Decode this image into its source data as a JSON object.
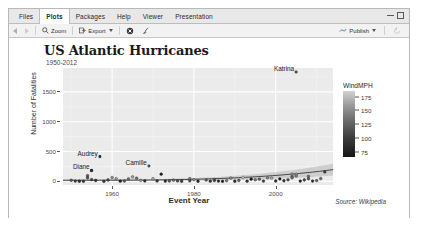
{
  "window": {
    "tabs": [
      {
        "label": "Files",
        "active": false
      },
      {
        "label": "Plots",
        "active": true
      },
      {
        "label": "Packages",
        "active": false
      },
      {
        "label": "Help",
        "active": false
      },
      {
        "label": "Viewer",
        "active": false
      },
      {
        "label": "Presentation",
        "active": false
      }
    ],
    "controls": {
      "minimize": "minimize-icon",
      "maximize": "maximize-icon"
    }
  },
  "toolbar": {
    "back_icon": "back-arrow-icon",
    "forward_icon": "forward-arrow-icon",
    "zoom_label": "Zoom",
    "zoom_icon": "magnifier-icon",
    "export_label": "Export",
    "export_icon": "export-icon",
    "remove_icon": "remove-plot-icon",
    "clear_icon": "clear-all-plots-icon",
    "publish_label": "Publish",
    "publish_icon": "publish-icon",
    "refresh_icon": "refresh-icon"
  },
  "chart_data": {
    "type": "scatter",
    "title": "US Atlantic Hurricanes",
    "subtitle": "1950-2012",
    "caption": "Source: Wikipedia",
    "xlabel": "Event Year",
    "ylabel": "Number of Fatalities",
    "xlim": [
      1948,
      2014
    ],
    "ylim": [
      -60,
      1900
    ],
    "xticks": [
      1960,
      1980,
      2000
    ],
    "yticks": [
      0,
      500,
      1000,
      1500
    ],
    "ytick_labels": [
      "0",
      "500",
      "1000",
      "1500"
    ],
    "grid": true,
    "panel_background": "#ebebeb",
    "gridline_color": "#ffffff",
    "point_color_scale": "grey",
    "smooth_line": true,
    "smooth_line_color": "#3a3a3a",
    "smooth_ribbon_color": "#b4b4b4",
    "legend": {
      "title": "WindMPH",
      "position": "right",
      "ticks": [
        175,
        150,
        125,
        100,
        75
      ],
      "tick_labels": [
        "175",
        "150",
        "125",
        "100",
        "75"
      ],
      "gradient_high": "#d2d2d2",
      "gradient_low": "#151515"
    },
    "annotations": [
      {
        "label": "Katrina",
        "x": 2005,
        "y": 1833
      },
      {
        "label": "Audrey",
        "x": 1957,
        "y": 416
      },
      {
        "label": "Diane",
        "x": 1955,
        "y": 184
      },
      {
        "label": "Camille",
        "x": 1969,
        "y": 259
      }
    ],
    "points": [
      {
        "x": 1950,
        "y": 19,
        "wind": 110
      },
      {
        "x": 1951,
        "y": 6,
        "wind": 95
      },
      {
        "x": 1952,
        "y": 3,
        "wind": 85
      },
      {
        "x": 1953,
        "y": 2,
        "wind": 90
      },
      {
        "x": 1954,
        "y": 95,
        "wind": 115
      },
      {
        "x": 1954,
        "y": 60,
        "wind": 105
      },
      {
        "x": 1955,
        "y": 184,
        "wind": 120
      },
      {
        "x": 1955,
        "y": 30,
        "wind": 100
      },
      {
        "x": 1956,
        "y": 15,
        "wind": 85
      },
      {
        "x": 1957,
        "y": 416,
        "wind": 145
      },
      {
        "x": 1958,
        "y": 2,
        "wind": 90
      },
      {
        "x": 1959,
        "y": 24,
        "wind": 100
      },
      {
        "x": 1960,
        "y": 65,
        "wind": 140
      },
      {
        "x": 1961,
        "y": 46,
        "wind": 150
      },
      {
        "x": 1962,
        "y": 4,
        "wind": 80
      },
      {
        "x": 1963,
        "y": 7,
        "wind": 110
      },
      {
        "x": 1964,
        "y": 41,
        "wind": 125
      },
      {
        "x": 1965,
        "y": 75,
        "wind": 150
      },
      {
        "x": 1966,
        "y": 54,
        "wind": 125
      },
      {
        "x": 1967,
        "y": 18,
        "wind": 145
      },
      {
        "x": 1968,
        "y": 9,
        "wind": 85
      },
      {
        "x": 1969,
        "y": 259,
        "wind": 175
      },
      {
        "x": 1970,
        "y": 46,
        "wind": 160
      },
      {
        "x": 1971,
        "y": 8,
        "wind": 90
      },
      {
        "x": 1972,
        "y": 122,
        "wind": 75
      },
      {
        "x": 1973,
        "y": 5,
        "wind": 80
      },
      {
        "x": 1974,
        "y": 8,
        "wind": 110
      },
      {
        "x": 1975,
        "y": 21,
        "wind": 120
      },
      {
        "x": 1976,
        "y": 9,
        "wind": 100
      },
      {
        "x": 1977,
        "y": 3,
        "wind": 95
      },
      {
        "x": 1979,
        "y": 45,
        "wind": 130
      },
      {
        "x": 1979,
        "y": 10,
        "wind": 105
      },
      {
        "x": 1980,
        "y": 28,
        "wind": 145
      },
      {
        "x": 1981,
        "y": 3,
        "wind": 85
      },
      {
        "x": 1983,
        "y": 22,
        "wind": 115
      },
      {
        "x": 1984,
        "y": 4,
        "wind": 90
      },
      {
        "x": 1985,
        "y": 30,
        "wind": 125
      },
      {
        "x": 1985,
        "y": 14,
        "wind": 100
      },
      {
        "x": 1986,
        "y": 5,
        "wind": 80
      },
      {
        "x": 1987,
        "y": 2,
        "wind": 75
      },
      {
        "x": 1988,
        "y": 12,
        "wind": 130
      },
      {
        "x": 1989,
        "y": 56,
        "wind": 140
      },
      {
        "x": 1990,
        "y": 3,
        "wind": 85
      },
      {
        "x": 1991,
        "y": 17,
        "wind": 115
      },
      {
        "x": 1992,
        "y": 65,
        "wind": 175
      },
      {
        "x": 1993,
        "y": 4,
        "wind": 90
      },
      {
        "x": 1994,
        "y": 38,
        "wind": 70
      },
      {
        "x": 1995,
        "y": 26,
        "wind": 125
      },
      {
        "x": 1996,
        "y": 37,
        "wind": 115
      },
      {
        "x": 1997,
        "y": 6,
        "wind": 95
      },
      {
        "x": 1998,
        "y": 58,
        "wind": 135
      },
      {
        "x": 1999,
        "y": 56,
        "wind": 155
      },
      {
        "x": 2000,
        "y": 7,
        "wind": 85
      },
      {
        "x": 2001,
        "y": 41,
        "wind": 75
      },
      {
        "x": 2002,
        "y": 11,
        "wind": 90
      },
      {
        "x": 2003,
        "y": 26,
        "wind": 105
      },
      {
        "x": 2004,
        "y": 120,
        "wind": 145
      },
      {
        "x": 2004,
        "y": 85,
        "wind": 130
      },
      {
        "x": 2004,
        "y": 60,
        "wind": 120
      },
      {
        "x": 2005,
        "y": 1833,
        "wind": 175
      },
      {
        "x": 2005,
        "y": 120,
        "wind": 150
      },
      {
        "x": 2005,
        "y": 90,
        "wind": 135
      },
      {
        "x": 2006,
        "y": 5,
        "wind": 80
      },
      {
        "x": 2007,
        "y": 24,
        "wind": 100
      },
      {
        "x": 2008,
        "y": 82,
        "wind": 125
      },
      {
        "x": 2008,
        "y": 43,
        "wind": 110
      },
      {
        "x": 2009,
        "y": 6,
        "wind": 85
      },
      {
        "x": 2010,
        "y": 14,
        "wind": 115
      },
      {
        "x": 2011,
        "y": 47,
        "wind": 120
      },
      {
        "x": 2012,
        "y": 159,
        "wind": 95
      }
    ]
  }
}
